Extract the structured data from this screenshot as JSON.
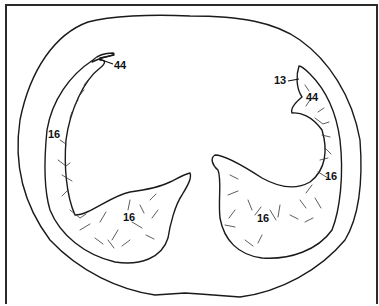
{
  "figure": {
    "labels": [
      {
        "id": "label-44-left",
        "text": "44"
      },
      {
        "id": "label-16-left-upper",
        "text": "16"
      },
      {
        "id": "label-16-left-lower",
        "text": "16"
      },
      {
        "id": "label-13-right",
        "text": "13"
      },
      {
        "id": "label-44-right",
        "text": "44"
      },
      {
        "id": "label-16-right-upper",
        "text": "16"
      },
      {
        "id": "label-16-right-lower",
        "text": "16"
      }
    ],
    "colors": {
      "line": "#1a1a1a",
      "background": "#ffffff"
    }
  }
}
